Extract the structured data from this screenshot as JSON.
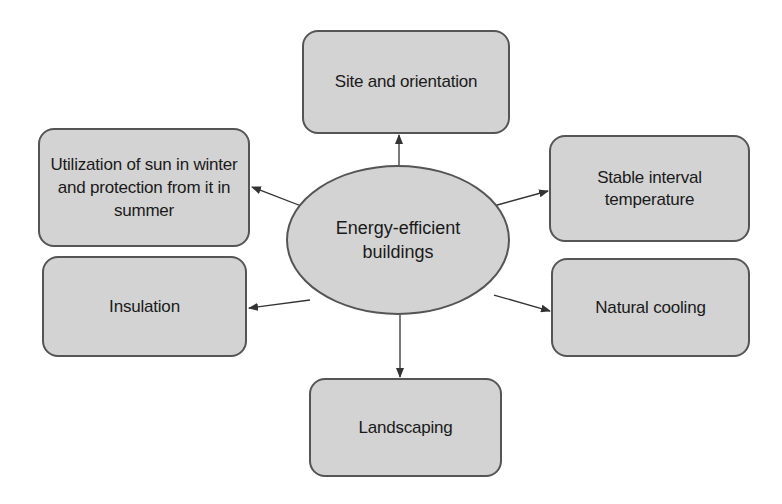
{
  "diagram": {
    "type": "mind-map",
    "center": {
      "label": "Energy-efficient buildings",
      "line1": "Energy-efficient",
      "line2": "buildings"
    },
    "nodes": [
      {
        "id": "site",
        "label": "Site and orientation",
        "position": "top"
      },
      {
        "id": "sun",
        "label": "Utilization of sun in winter and protection from it in summer",
        "position": "upper-left"
      },
      {
        "id": "stable",
        "label": "Stable interval temperature",
        "position": "upper-right"
      },
      {
        "id": "insulation",
        "label": "Insulation",
        "position": "lower-left"
      },
      {
        "id": "cooling",
        "label": "Natural cooling",
        "position": "lower-right"
      },
      {
        "id": "landscaping",
        "label": "Landscaping",
        "position": "bottom"
      }
    ],
    "edges": [
      {
        "from": "center",
        "to": "site"
      },
      {
        "from": "center",
        "to": "sun"
      },
      {
        "from": "center",
        "to": "stable"
      },
      {
        "from": "center",
        "to": "insulation"
      },
      {
        "from": "center",
        "to": "cooling"
      },
      {
        "from": "center",
        "to": "landscaping"
      }
    ],
    "colors": {
      "node_fill": "#d3d3d3",
      "node_border": "#555555",
      "text": "#1a1a1a",
      "arrow": "#333333",
      "background": "#ffffff"
    }
  }
}
